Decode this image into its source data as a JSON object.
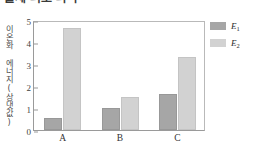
{
  "title": {
    "text": "출제 의도 파악",
    "clipped": true
  },
  "chart_data": {
    "type": "bar",
    "title": "",
    "xlabel": "",
    "ylabel": "이온화 에너지(상댓값)",
    "categories": [
      "A",
      "B",
      "C"
    ],
    "series": [
      {
        "name": "E1",
        "label": "E",
        "sub": "1",
        "color": "#a6a6a6",
        "values": [
          0.55,
          1.0,
          1.65
        ]
      },
      {
        "name": "E2",
        "label": "E",
        "sub": "2",
        "color": "#d2d2d2",
        "values": [
          4.65,
          1.5,
          3.3
        ]
      }
    ],
    "ylim": [
      0,
      5
    ],
    "yticks": [
      0,
      1,
      2,
      3,
      4,
      5
    ],
    "ytick_labels": [
      "0",
      "1",
      "2",
      "3",
      "4",
      "5"
    ],
    "grid": false,
    "legend_position": "right-top"
  },
  "legend": {
    "entries": [
      {
        "label": "E",
        "sub": "1"
      },
      {
        "label": "E",
        "sub": "2"
      }
    ]
  }
}
